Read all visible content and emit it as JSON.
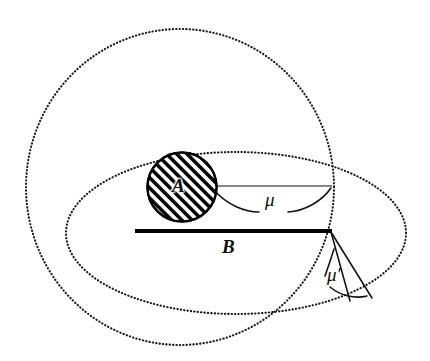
{
  "figure": {
    "type": "geometric-diagram",
    "background_color": "#ffffff",
    "ink_color": "#111111"
  },
  "labels": {
    "disc": "A",
    "segment": "B",
    "angle_upper": "μ",
    "angle_lower": "μ′"
  },
  "shapes": {
    "large_dotted_circle": {
      "name": "large-dotted-circle",
      "style": "dotted",
      "cx": 180,
      "cy": 187,
      "rx": 154,
      "ry": 158
    },
    "small_dotted_ellipse": {
      "name": "small-dotted-ellipse",
      "style": "dotted",
      "cx": 236,
      "cy": 233,
      "rx": 170,
      "ry": 81
    },
    "hatched_disc_A": {
      "name": "hatched-disc-a",
      "style": "solid-outline-hatched",
      "cx": 182,
      "cy": 187,
      "r": 35,
      "hatch_angle_deg": 45
    },
    "segment_B": {
      "name": "segment-b",
      "style": "thick-solid",
      "x1": 135,
      "y1": 231,
      "x2": 331,
      "y2": 231
    },
    "chord_mu": {
      "name": "chord-mu",
      "style": "thin-solid",
      "x1": 216,
      "y1": 186,
      "x2": 331,
      "y2": 186
    },
    "arc_mu": {
      "name": "arc-mu",
      "style": "thin-solid-arc-with-label-gap"
    },
    "ray_mu_prime_left": {
      "name": "ray-mu-prime-left",
      "x1": 331,
      "y1": 231,
      "x2": 350,
      "y2": 300
    },
    "ray_mu_prime_right": {
      "name": "ray-mu-prime-right",
      "x1": 331,
      "y1": 231,
      "x2": 371,
      "y2": 298
    },
    "arc_mu_prime": {
      "name": "arc-mu-prime",
      "style": "thin-solid-arc-with-label-gap"
    }
  }
}
